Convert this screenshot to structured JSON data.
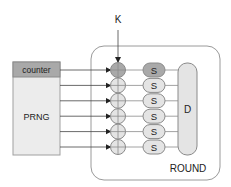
{
  "diagram": {
    "key_label": "K",
    "prng": {
      "header": "counter",
      "label": "PRNG"
    },
    "round": {
      "label": "ROUND"
    },
    "sbox_label": "S",
    "diffusion_label": "D",
    "lanes": 6,
    "colors": {
      "highlight": "#a9a9a9",
      "normal": "#e4e4e4",
      "stroke": "#8a8a8a",
      "line": "#444444",
      "round_border": "#9a9a9a"
    }
  }
}
